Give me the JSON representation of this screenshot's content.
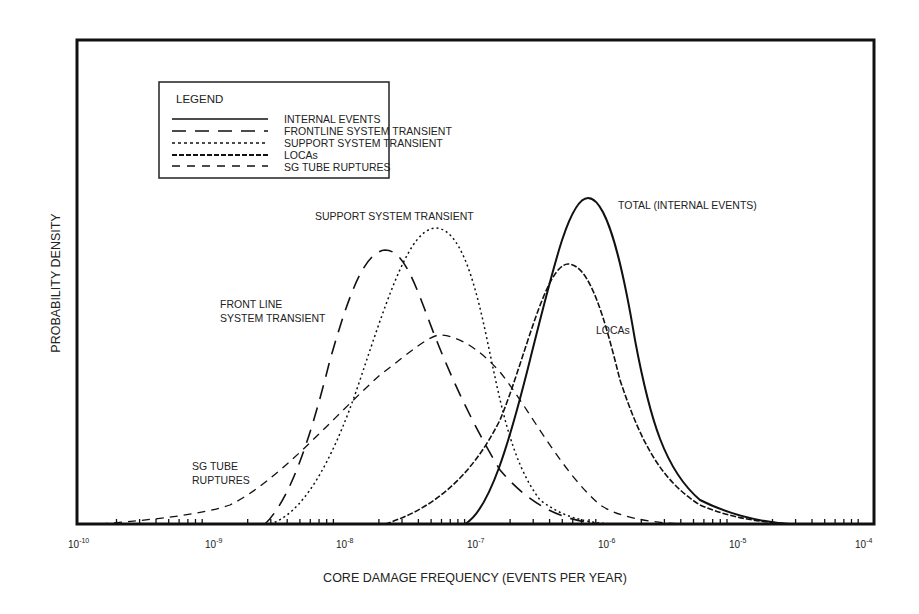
{
  "chart_data": {
    "type": "line",
    "title": "",
    "xlabel": "CORE DAMAGE FREQUENCY (EVENTS PER YEAR)",
    "ylabel": "PROBABILITY DENSITY",
    "xscale": "log",
    "xlim": [
      1e-10,
      0.0001
    ],
    "x_tick_labels": [
      "10-10",
      "10-9",
      "10-8",
      "10-7",
      "10-6",
      "10-5",
      "10-4"
    ],
    "grid": false,
    "legend_position": "upper-left",
    "legend_title": "LEGEND",
    "legend": [
      {
        "label": "INTERNAL EVENTS",
        "style": "solid"
      },
      {
        "label": "FRONTLINE SYSTEM TRANSIENT",
        "style": "long-dash"
      },
      {
        "label": "SUPPORT SYSTEM TRANSIENT",
        "style": "dotted"
      },
      {
        "label": "LOCAs",
        "style": "dash-dot"
      },
      {
        "label": "SG TUBE RUPTURES",
        "style": "dashed"
      }
    ],
    "annotations": [
      "TOTAL (INTERNAL EVENTS)",
      "SUPPORT SYSTEM TRANSIENT",
      "FRONT LINE SYSTEM TRANSIENT",
      "LOCAs",
      "SG TUBE RUPTURES"
    ],
    "series": [
      {
        "name": "INTERNAL EVENTS (TOTAL)",
        "style": "solid",
        "peak_x": 7e-07,
        "peak_rel_height": 1.0,
        "x": [
          1.5e-07,
          3e-07,
          5e-07,
          7e-07,
          1e-06,
          2e-06,
          5e-06,
          1e-05,
          1.5e-05
        ],
        "y": [
          0.0,
          0.45,
          0.9,
          1.0,
          0.85,
          0.35,
          0.08,
          0.02,
          0.0
        ]
      },
      {
        "name": "FRONTLINE SYSTEM TRANSIENT",
        "style": "long-dash",
        "peak_x": 2e-08,
        "peak_rel_height": 0.85,
        "x": [
          2.5e-09,
          5e-09,
          1e-08,
          2e-08,
          4e-08,
          1e-07,
          3e-07,
          1e-06
        ],
        "y": [
          0.0,
          0.15,
          0.55,
          0.85,
          0.6,
          0.2,
          0.03,
          0.0
        ]
      },
      {
        "name": "SUPPORT SYSTEM TRANSIENT",
        "style": "dotted",
        "peak_x": 5e-08,
        "peak_rel_height": 0.99,
        "x": [
          3e-09,
          7e-09,
          1.5e-08,
          3e-08,
          5e-08,
          1e-07,
          2e-07,
          5e-07,
          1e-06
        ],
        "y": [
          0.0,
          0.15,
          0.5,
          0.9,
          0.99,
          0.55,
          0.15,
          0.02,
          0.0
        ]
      },
      {
        "name": "LOCAs",
        "style": "dash-dot",
        "peak_x": 5e-07,
        "peak_rel_height": 0.85,
        "x": [
          2e-08,
          1e-07,
          2e-07,
          5e-07,
          1e-06,
          2e-06,
          5e-06,
          1e-05,
          1.5e-05
        ],
        "y": [
          0.0,
          0.2,
          0.5,
          0.85,
          0.7,
          0.3,
          0.07,
          0.02,
          0.0
        ]
      },
      {
        "name": "SG TUBE RUPTURES",
        "style": "dashed",
        "peak_x": 5e-08,
        "peak_rel_height": 0.56,
        "x": [
          1.5e-10,
          1e-09,
          5e-09,
          1e-08,
          3e-08,
          5e-08,
          1e-07,
          3e-07,
          1e-06
        ],
        "y": [
          0.0,
          0.05,
          0.25,
          0.4,
          0.53,
          0.56,
          0.45,
          0.15,
          0.0
        ]
      }
    ]
  },
  "legend": {
    "title": "LEGEND",
    "items": [
      "INTERNAL EVENTS",
      "FRONTLINE SYSTEM TRANSIENT",
      "SUPPORT SYSTEM TRANSIENT",
      "LOCAs",
      "SG TUBE RUPTURES"
    ]
  },
  "labels": {
    "total": "TOTAL (INTERNAL EVENTS)",
    "support": "SUPPORT SYSTEM TRANSIENT",
    "frontline_1": "FRONT LINE",
    "frontline_2": "SYSTEM TRANSIENT",
    "locas": "LOCAs",
    "sg_1": "SG TUBE",
    "sg_2": "RUPTURES"
  },
  "axes": {
    "xlabel": "CORE DAMAGE FREQUENCY (EVENTS PER YEAR)",
    "ylabel": "PROBABILITY DENSITY",
    "ticks": [
      {
        "base": "10",
        "exp": "-10"
      },
      {
        "base": "10",
        "exp": "-9"
      },
      {
        "base": "10",
        "exp": "-8"
      },
      {
        "base": "10",
        "exp": "-7"
      },
      {
        "base": "10",
        "exp": "-6"
      },
      {
        "base": "10",
        "exp": "-5"
      },
      {
        "base": "10",
        "exp": "-4"
      }
    ]
  }
}
